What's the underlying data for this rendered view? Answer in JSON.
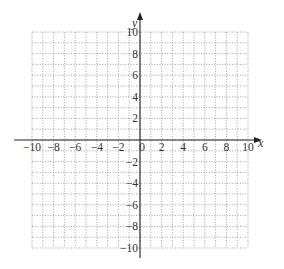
{
  "chart_data": {
    "type": "scatter",
    "title": "",
    "xlabel": "x",
    "ylabel": "y",
    "xlim": [
      -10,
      10
    ],
    "ylim": [
      -10,
      10
    ],
    "grid": true,
    "grid_step": 1,
    "grid_style": "dotted",
    "x_ticks": [
      -10,
      -8,
      -6,
      -4,
      -2,
      0,
      2,
      4,
      6,
      8,
      10
    ],
    "x_tick_labels": [
      "−10",
      "−8",
      "−6",
      "−4",
      "−2",
      "0",
      "2",
      "4",
      "6",
      "8",
      "10"
    ],
    "y_ticks": [
      10,
      8,
      6,
      4,
      2,
      -2,
      -4,
      -6,
      -8,
      -10
    ],
    "y_tick_labels": [
      "10",
      "8",
      "6",
      "4",
      "2",
      "−2",
      "−4",
      "−6",
      "−8",
      "−10"
    ],
    "series": [],
    "legend": null
  },
  "axes": {
    "x_label": "x",
    "y_label": "y",
    "axis_color": "#222222",
    "grid_color": "#8a8a8a"
  }
}
